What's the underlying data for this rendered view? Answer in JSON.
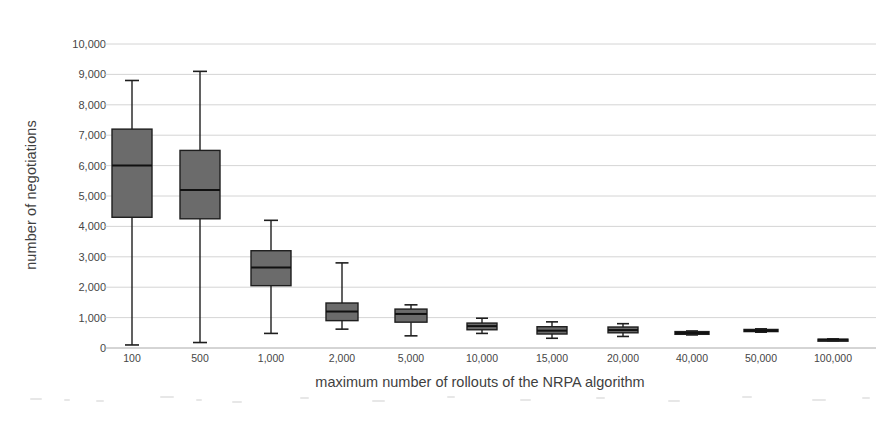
{
  "chart_data": {
    "type": "box",
    "title": "",
    "xlabel": "maximum number of rollouts of the NRPA algorithm",
    "ylabel": "number of negotiations",
    "categories": [
      "100",
      "500",
      "1,000",
      "2,000",
      "5,000",
      "10,000",
      "15,000",
      "20,000",
      "40,000",
      "50,000",
      "100,000"
    ],
    "ylim": [
      0,
      10000
    ],
    "ytick_labels": [
      "0",
      "1,000",
      "2,000",
      "3,000",
      "4,000",
      "5,000",
      "6,000",
      "7,000",
      "8,000",
      "9,000",
      "10,000"
    ],
    "ytick_values": [
      0,
      1000,
      2000,
      3000,
      4000,
      5000,
      6000,
      7000,
      8000,
      9000,
      10000
    ],
    "grid": true,
    "legend": "none",
    "boxes": [
      {
        "category": "100",
        "whisker_low": 100,
        "q1": 4300,
        "median": 6000,
        "q3": 7200,
        "whisker_high": 8800
      },
      {
        "category": "500",
        "whisker_low": 180,
        "q1": 4250,
        "median": 5200,
        "q3": 6500,
        "whisker_high": 9100
      },
      {
        "category": "1,000",
        "whisker_low": 480,
        "q1": 2050,
        "median": 2650,
        "q3": 3200,
        "whisker_high": 4200
      },
      {
        "category": "2,000",
        "whisker_low": 620,
        "q1": 900,
        "median": 1200,
        "q3": 1480,
        "whisker_high": 2800
      },
      {
        "category": "5,000",
        "whisker_low": 400,
        "q1": 850,
        "median": 1120,
        "q3": 1280,
        "whisker_high": 1420
      },
      {
        "category": "10,000",
        "whisker_low": 480,
        "q1": 600,
        "median": 720,
        "q3": 820,
        "whisker_high": 980
      },
      {
        "category": "15,000",
        "whisker_low": 320,
        "q1": 460,
        "median": 570,
        "q3": 700,
        "whisker_high": 860
      },
      {
        "category": "20,000",
        "whisker_low": 380,
        "q1": 500,
        "median": 590,
        "q3": 690,
        "whisker_high": 800
      },
      {
        "category": "40,000",
        "whisker_low": 430,
        "q1": 450,
        "median": 490,
        "q3": 540,
        "whisker_high": 560
      },
      {
        "category": "50,000",
        "whisker_low": 520,
        "q1": 540,
        "median": 570,
        "q3": 610,
        "whisker_high": 630
      },
      {
        "category": "100,000",
        "whisker_low": 240,
        "q1": 250,
        "median": 270,
        "q3": 290,
        "whisker_high": 300
      }
    ],
    "colors": {
      "box_fill": "#6b6b6b",
      "box_stroke": "#1e1e1e",
      "grid": "#c9c9c9",
      "text": "#3f3f3f",
      "background": "#ffffff"
    }
  }
}
